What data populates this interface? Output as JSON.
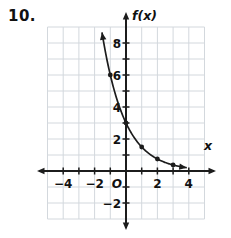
{
  "problem": {
    "number_label": "10."
  },
  "colors": {
    "background": "#ffffff",
    "grid": "#d3d8dd",
    "axis": "#1c1c1c",
    "curve": "#1c1c1c",
    "text": "#111111"
  },
  "chart_data": {
    "type": "line",
    "title": "",
    "xlabel": "x",
    "ylabel": "f(x)",
    "origin_label": "O",
    "xlim": [
      -5,
      5
    ],
    "ylim": [
      -3,
      9
    ],
    "grid": true,
    "x_tick_marks": [
      -4,
      -3,
      -2,
      -1,
      1,
      2,
      3,
      4
    ],
    "y_tick_marks": [
      -2,
      -1,
      1,
      2,
      3,
      4,
      5,
      6,
      7,
      8
    ],
    "x_tick_labels": [
      {
        "v": -4,
        "t": "−4"
      },
      {
        "v": -2,
        "t": "−2"
      },
      {
        "v": 2,
        "t": "2"
      },
      {
        "v": 4,
        "t": "4"
      }
    ],
    "y_tick_labels": [
      {
        "v": -2,
        "t": "−2"
      },
      {
        "v": 2,
        "t": "2"
      },
      {
        "v": 4,
        "t": "4"
      },
      {
        "v": 6,
        "t": "6"
      },
      {
        "v": 8,
        "t": "8"
      }
    ],
    "points": [
      {
        "x": -1,
        "y": 6
      },
      {
        "x": 0,
        "y": 3
      },
      {
        "x": 1,
        "y": 1.5
      },
      {
        "x": 2,
        "y": 0.75
      },
      {
        "x": 3,
        "y": 0.375
      }
    ],
    "curve": {
      "x_draw_range": [
        -1.53,
        3.88
      ],
      "arrow_start": true,
      "arrow_end": true
    }
  }
}
